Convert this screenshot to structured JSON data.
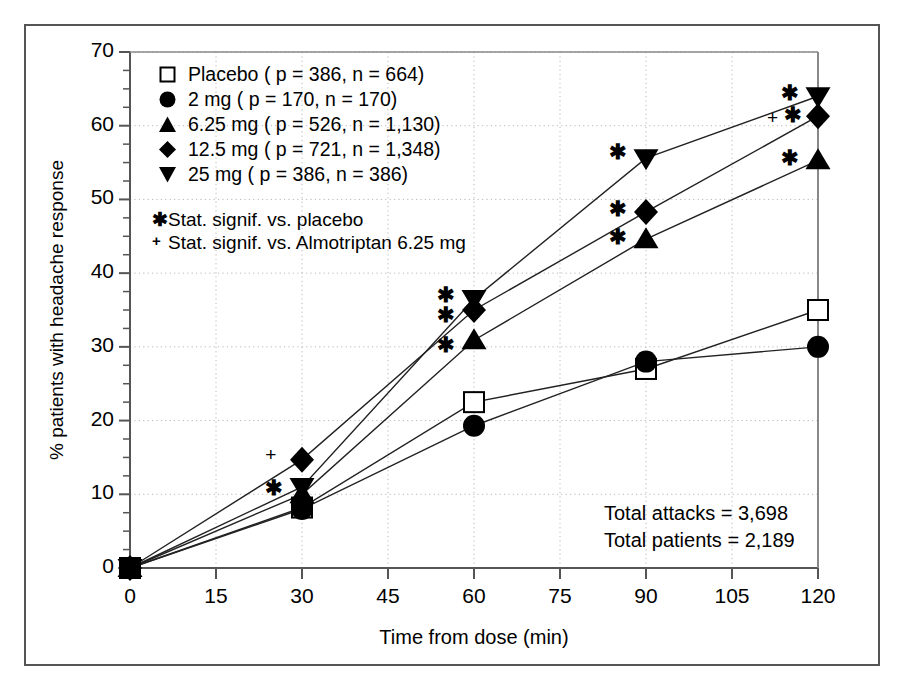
{
  "axes": {
    "xlabel": "Time from dose (min)",
    "ylabel": "% patients with headache response",
    "xticks": [
      "0",
      "15",
      "30",
      "45",
      "60",
      "75",
      "90",
      "105",
      "120"
    ],
    "yticks": [
      "0",
      "10",
      "20",
      "30",
      "40",
      "50",
      "60",
      "70"
    ],
    "xlim": [
      0,
      120
    ],
    "ylim": [
      0,
      70
    ]
  },
  "legend": {
    "items": [
      {
        "marker": "open-square",
        "label": "Placebo ( p = 386, n = 664)"
      },
      {
        "marker": "filled-circle",
        "label": "2 mg ( p = 170, n = 170)"
      },
      {
        "marker": "filled-triangle-up",
        "label": "6.25 mg ( p = 526, n = 1,130)"
      },
      {
        "marker": "filled-diamond",
        "label": "12.5 mg ( p = 721, n = 1,348)"
      },
      {
        "marker": "filled-triangle-down",
        "label": "25 mg ( p = 386, n = 386)"
      }
    ]
  },
  "significance_notes": [
    {
      "symbol": "✱",
      "text": "Stat. signif. vs. placebo"
    },
    {
      "symbol": "+",
      "text": "Stat. signif. vs. Almotriptan 6.25 mg"
    }
  ],
  "totals": {
    "attacks": "Total attacks = 3,698",
    "patients": "Total patients = 2,189"
  },
  "annotations": [
    {
      "symbol": "+",
      "x": 25,
      "y": 15.3
    },
    {
      "symbol": "✱",
      "x": 25,
      "y": 11.0
    },
    {
      "symbol": "✱",
      "x": 55,
      "y": 37.2
    },
    {
      "symbol": "✱",
      "x": 55,
      "y": 34.5
    },
    {
      "symbol": "✱",
      "x": 55,
      "y": 30.4
    },
    {
      "symbol": "✱",
      "x": 85,
      "y": 56.6
    },
    {
      "symbol": "✱",
      "x": 85,
      "y": 48.8
    },
    {
      "symbol": "✱",
      "x": 85,
      "y": 45.0
    },
    {
      "symbol": "✱",
      "x": 115,
      "y": 64.6
    },
    {
      "symbol": "+",
      "x": 112.5,
      "y": 61.0
    },
    {
      "symbol": "✱",
      "x": 115.5,
      "y": 61.6
    },
    {
      "symbol": "✱",
      "x": 115,
      "y": 55.8
    }
  ],
  "chart_data": {
    "type": "line",
    "title": "",
    "xlabel": "Time from dose (min)",
    "ylabel": "% patients with headache response",
    "xlim": [
      0,
      120
    ],
    "ylim": [
      0,
      70
    ],
    "grid": true,
    "legend_position": "upper-left",
    "x": [
      0,
      30,
      60,
      90,
      120
    ],
    "series": [
      {
        "name": "Placebo ( p = 386, n = 664)",
        "marker": "open-square",
        "values": [
          0,
          8.2,
          22.5,
          27.0,
          35.0
        ]
      },
      {
        "name": "2 mg ( p = 170, n = 170)",
        "marker": "filled-circle",
        "values": [
          0,
          8.0,
          19.3,
          28.0,
          30.0
        ]
      },
      {
        "name": "6.25 mg ( p = 526, n = 1,130)",
        "marker": "filled-triangle-up",
        "values": [
          0,
          10.0,
          30.9,
          44.6,
          55.3
        ]
      },
      {
        "name": "12.5 mg ( p = 721, n = 1,348)",
        "marker": "filled-diamond",
        "values": [
          0,
          14.7,
          35.0,
          48.3,
          61.3
        ]
      },
      {
        "name": "25 mg ( p = 386, n = 386)",
        "marker": "filled-triangle-down",
        "values": [
          0,
          11.0,
          36.5,
          55.6,
          64.0
        ]
      }
    ]
  }
}
